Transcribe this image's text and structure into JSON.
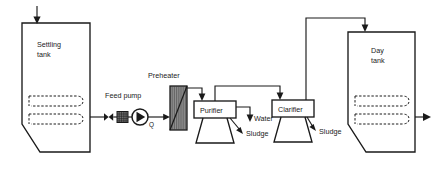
{
  "diagram": {
    "type": "process-flow-diagram",
    "colors": {
      "line": "#1a1a1a",
      "background": "#ffffff",
      "heater_fill": "#8f8f8f",
      "strainer_fill": "#6e6e6e"
    },
    "equipment": [
      {
        "id": "settling-tank",
        "label_line1": "Settling",
        "label_line2": "tank",
        "shape": "tank-with-hopper",
        "has_heating_coil": true
      },
      {
        "id": "feed-pump",
        "label": "Feed pump",
        "shape": "centrifugal-pump",
        "flow_symbol": "Q"
      },
      {
        "id": "preheater",
        "label": "Preheater",
        "shape": "hatched-heat-exchanger"
      },
      {
        "id": "purifier",
        "label": "Purifier",
        "shape": "box-on-conical-stand"
      },
      {
        "id": "clarifier",
        "label": "Clarifier",
        "shape": "box-on-conical-stand"
      },
      {
        "id": "day-tank",
        "label_line1": "Day",
        "label_line2": "tank",
        "shape": "tank-with-hopper",
        "has_heating_coil": true
      }
    ],
    "stream_labels": {
      "purifier_water": "Water",
      "purifier_sludge": "Sludge",
      "clarifier_sludge": "Sludge",
      "pump_flow": "Q"
    }
  }
}
